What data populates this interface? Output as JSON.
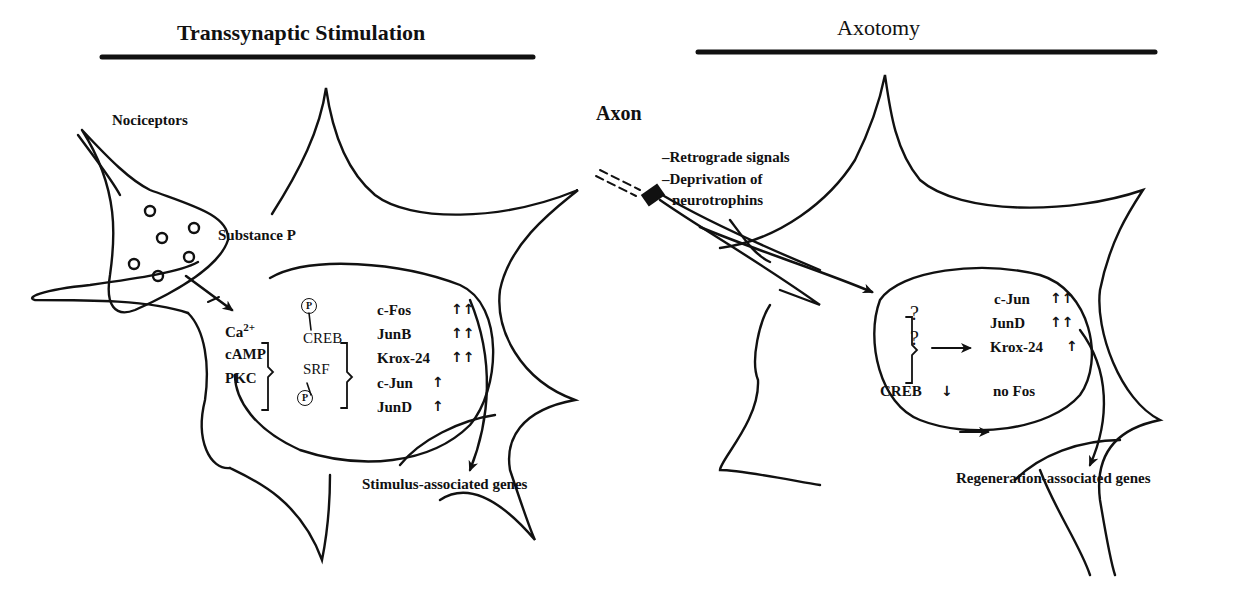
{
  "left_panel": {
    "title": "Transsynaptic Stimulation",
    "nociceptors": "Nociceptors",
    "substance_p": "Substance P",
    "second_messengers": [
      "Ca",
      "cAMP",
      "PKC"
    ],
    "ca_superscript": "2+",
    "transcription_factors": [
      "CREB",
      "SRF"
    ],
    "phospho": "P",
    "genes": [
      {
        "name": "c-Fos",
        "arrows": "↑↑"
      },
      {
        "name": "JunB",
        "arrows": "↑↑"
      },
      {
        "name": "Krox-24",
        "arrows": "↑↑"
      },
      {
        "name": "c-Jun",
        "arrows": "↑"
      },
      {
        "name": "JunD",
        "arrows": "↑"
      }
    ],
    "output": "Stimulus-associated genes"
  },
  "right_panel": {
    "title": "Axotomy",
    "axon": "Axon",
    "signals": [
      "–Retrograde signals",
      "–Deprivation of",
      "neurotrophins"
    ],
    "unknown": [
      "?",
      "?"
    ],
    "genes": [
      {
        "name": "c-Jun",
        "arrows": "↑↑"
      },
      {
        "name": "JunD",
        "arrows": "↑↑"
      },
      {
        "name": "Krox-24",
        "arrows": "↑"
      }
    ],
    "creb": {
      "name": "CREB",
      "arrow": "↓",
      "result": "no Fos"
    },
    "output": "Regeneration-associated genes"
  }
}
